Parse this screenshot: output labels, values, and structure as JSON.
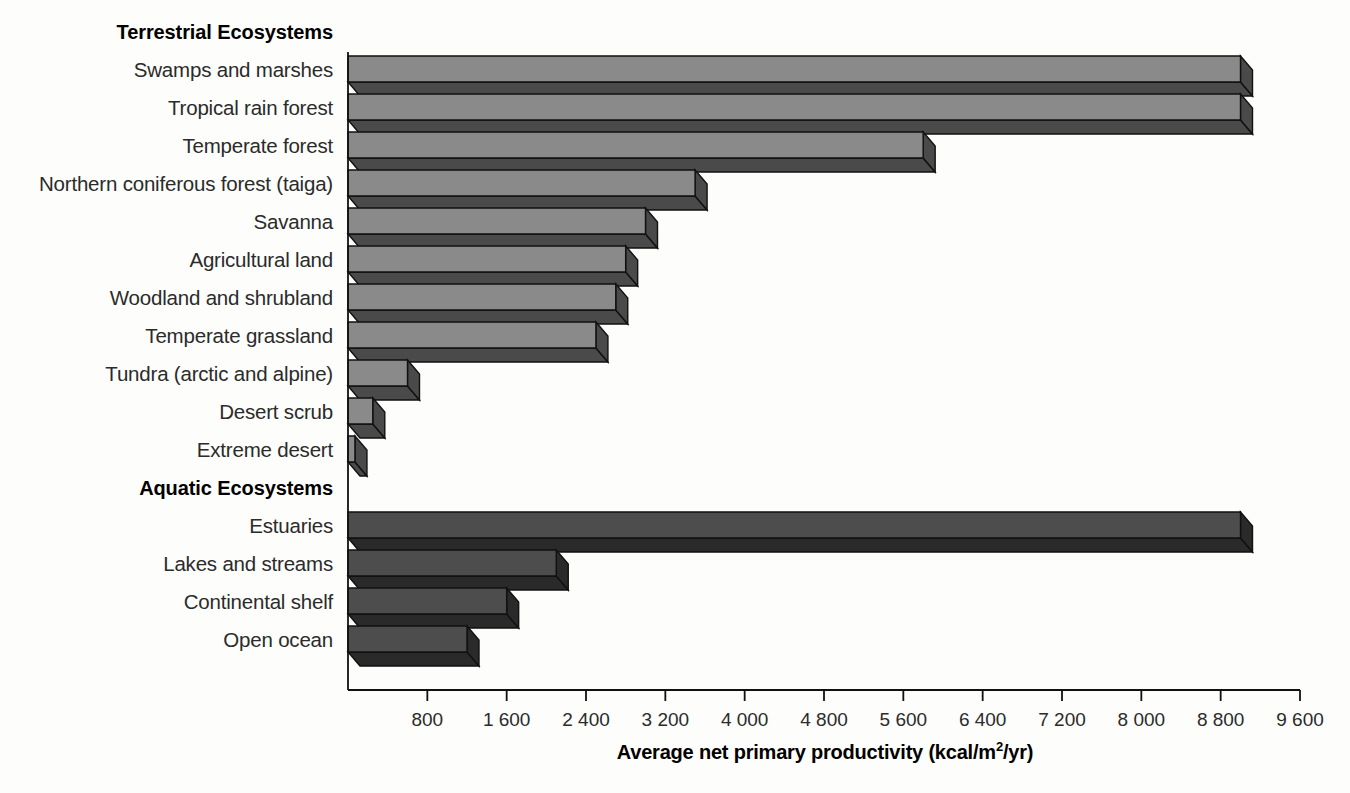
{
  "chart_data": {
    "type": "bar",
    "orientation": "horizontal",
    "title": "",
    "xlabel": "Average net primary productivity (kcal/m2/yr)",
    "xlabel_parts": {
      "pre": "Average net primary productivity (kcal/m",
      "sup": "2",
      "post": "/yr)"
    },
    "ylabel": "",
    "xlim": [
      0,
      9600
    ],
    "grid": false,
    "legend": false,
    "xticks": [
      800,
      1600,
      2400,
      3200,
      4000,
      4800,
      5600,
      6400,
      7200,
      8000,
      8800,
      9600
    ],
    "xticklabels": [
      "800",
      "1 600",
      "2 400",
      "3 200",
      "4 000",
      "4 800",
      "5 600",
      "6 400",
      "7 200",
      "8 000",
      "8 800",
      "9 600"
    ],
    "groups": [
      {
        "name": "Terrestrial Ecosystems",
        "categories": [
          "Swamps and marshes",
          "Tropical rain forest",
          "Temperate forest",
          "Northern coniferous forest (taiga)",
          "Savanna",
          "Agricultural land",
          "Woodland and shrubland",
          "Temperate grassland",
          "Tundra (arctic and alpine)",
          "Desert scrub",
          "Extreme desert"
        ],
        "values": [
          9000,
          9000,
          5800,
          3500,
          3000,
          2800,
          2700,
          2500,
          600,
          250,
          70
        ]
      },
      {
        "name": "Aquatic Ecosystems",
        "categories": [
          "Estuaries",
          "Lakes and streams",
          "Continental shelf",
          "Open ocean"
        ],
        "values": [
          9000,
          2100,
          1600,
          1200
        ]
      }
    ],
    "colors": {
      "terrestrial_top": "#8a8a8a",
      "terrestrial_side": "#4a4a4a",
      "aquatic_top": "#4d4d4d",
      "aquatic_side": "#2a2a2a",
      "outline": "#111111",
      "axis": "#111111",
      "background": "#fdfdfb"
    }
  }
}
